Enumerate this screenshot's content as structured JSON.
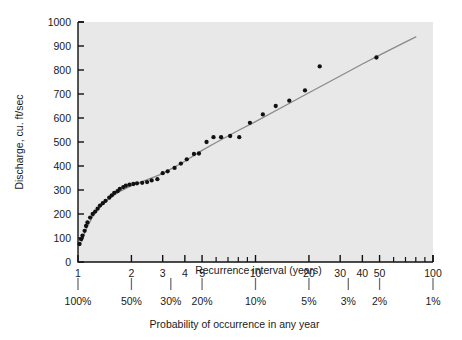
{
  "chart_data": {
    "type": "scatter",
    "title": "",
    "ylabel": "Discharge, cu. ft/sec",
    "xlabel": "Recurrence interval (years)",
    "xlabel2": "Probability of occurrence in any year",
    "xscale": "log",
    "xlim": [
      1,
      100
    ],
    "ylim": [
      0,
      1000
    ],
    "grid": false,
    "legend": null,
    "background_color": "#e8e8e8",
    "point_color": "#111111",
    "line_color": "#8a8a8a",
    "yticks": [
      0,
      100,
      200,
      300,
      400,
      500,
      600,
      700,
      800,
      900,
      1000
    ],
    "ytick_labels": [
      "0",
      "100",
      "200",
      "300",
      "400",
      "500",
      "600",
      "700",
      "800",
      "900",
      "1000"
    ],
    "xticks_labeled": [
      1,
      2,
      3,
      4,
      5,
      10,
      20,
      30,
      40,
      50,
      100
    ],
    "xtick_labels": [
      "1",
      "2",
      "3",
      "4",
      "5",
      "10",
      "20",
      "30",
      "40",
      "50",
      "100"
    ],
    "xticks_minor": [
      6,
      7,
      8,
      9,
      60,
      70,
      80,
      90
    ],
    "prob_ticks": [
      {
        "recurrence": 1,
        "label": "100%"
      },
      {
        "recurrence": 2,
        "label": "50%"
      },
      {
        "recurrence": 3.3333,
        "label": "30%"
      },
      {
        "recurrence": 5,
        "label": "20%"
      },
      {
        "recurrence": 10,
        "label": "10%"
      },
      {
        "recurrence": 20,
        "label": "5%"
      },
      {
        "recurrence": 33.333,
        "label": "3%"
      },
      {
        "recurrence": 50,
        "label": "2%"
      },
      {
        "recurrence": 100,
        "label": "1%"
      }
    ],
    "points": [
      {
        "x": 1.02,
        "y": 75
      },
      {
        "x": 1.04,
        "y": 95
      },
      {
        "x": 1.06,
        "y": 110
      },
      {
        "x": 1.09,
        "y": 130
      },
      {
        "x": 1.11,
        "y": 150
      },
      {
        "x": 1.13,
        "y": 165
      },
      {
        "x": 1.17,
        "y": 185
      },
      {
        "x": 1.21,
        "y": 200
      },
      {
        "x": 1.25,
        "y": 210
      },
      {
        "x": 1.29,
        "y": 222
      },
      {
        "x": 1.33,
        "y": 235
      },
      {
        "x": 1.38,
        "y": 245
      },
      {
        "x": 1.43,
        "y": 255
      },
      {
        "x": 1.5,
        "y": 268
      },
      {
        "x": 1.55,
        "y": 278
      },
      {
        "x": 1.6,
        "y": 288
      },
      {
        "x": 1.67,
        "y": 295
      },
      {
        "x": 1.72,
        "y": 305
      },
      {
        "x": 1.8,
        "y": 312
      },
      {
        "x": 1.86,
        "y": 318
      },
      {
        "x": 1.95,
        "y": 322
      },
      {
        "x": 2.05,
        "y": 325
      },
      {
        "x": 2.15,
        "y": 328
      },
      {
        "x": 2.3,
        "y": 330
      },
      {
        "x": 2.45,
        "y": 333
      },
      {
        "x": 2.6,
        "y": 340
      },
      {
        "x": 2.8,
        "y": 345
      },
      {
        "x": 3.0,
        "y": 370
      },
      {
        "x": 3.2,
        "y": 378
      },
      {
        "x": 3.5,
        "y": 392
      },
      {
        "x": 3.8,
        "y": 410
      },
      {
        "x": 4.1,
        "y": 428
      },
      {
        "x": 4.5,
        "y": 450
      },
      {
        "x": 4.8,
        "y": 452
      },
      {
        "x": 5.3,
        "y": 500
      },
      {
        "x": 5.8,
        "y": 520
      },
      {
        "x": 6.4,
        "y": 520
      },
      {
        "x": 7.2,
        "y": 525
      },
      {
        "x": 8.1,
        "y": 520
      },
      {
        "x": 9.3,
        "y": 580
      },
      {
        "x": 11.0,
        "y": 615
      },
      {
        "x": 13.0,
        "y": 650
      },
      {
        "x": 15.5,
        "y": 672
      },
      {
        "x": 19.0,
        "y": 715
      },
      {
        "x": 23.0,
        "y": 815
      },
      {
        "x": 48.0,
        "y": 852
      }
    ],
    "fit_line": [
      {
        "x": 1.05,
        "y": 85
      },
      {
        "x": 1.1,
        "y": 130
      },
      {
        "x": 1.2,
        "y": 185
      },
      {
        "x": 1.3,
        "y": 222
      },
      {
        "x": 1.5,
        "y": 265
      },
      {
        "x": 1.7,
        "y": 292
      },
      {
        "x": 2.0,
        "y": 318
      },
      {
        "x": 2.5,
        "y": 345
      },
      {
        "x": 3.0,
        "y": 368
      },
      {
        "x": 4.0,
        "y": 420
      },
      {
        "x": 5.0,
        "y": 465
      },
      {
        "x": 6.0,
        "y": 498
      },
      {
        "x": 8.0,
        "y": 548
      },
      {
        "x": 10.0,
        "y": 585
      },
      {
        "x": 15.0,
        "y": 655
      },
      {
        "x": 20.0,
        "y": 705
      },
      {
        "x": 30.0,
        "y": 775
      },
      {
        "x": 40.0,
        "y": 825
      },
      {
        "x": 50.0,
        "y": 862
      },
      {
        "x": 65.0,
        "y": 905
      },
      {
        "x": 80.0,
        "y": 938
      }
    ]
  }
}
